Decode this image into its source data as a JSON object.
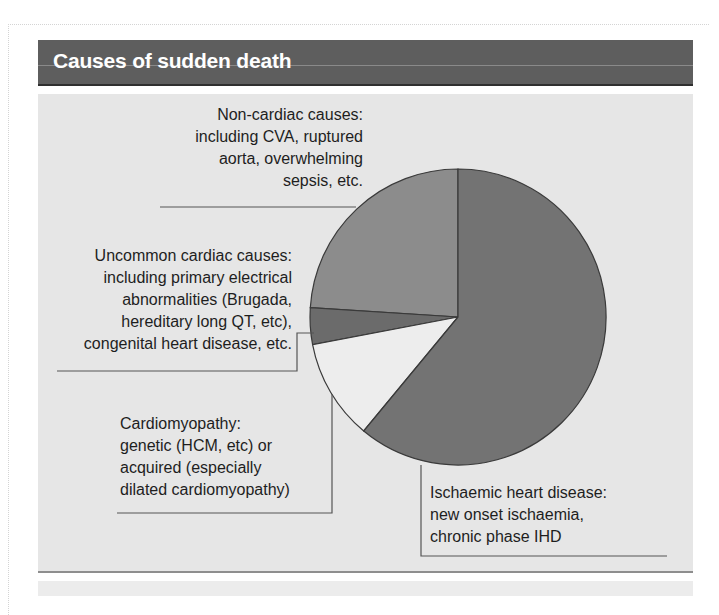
{
  "title": "Causes of sudden death",
  "chart_data": {
    "type": "pie",
    "title": "Causes of sudden death",
    "start_angle_deg": 90,
    "direction": "counterclockwise",
    "slices": [
      {
        "name": "Non-cardiac causes",
        "value": 24,
        "color": "#8c8c8c"
      },
      {
        "name": "Uncommon cardiac causes",
        "value": 4,
        "color": "#6b6b6b"
      },
      {
        "name": "Cardiomyopathy",
        "value": 11,
        "color": "#ededed"
      },
      {
        "name": "Ischaemic heart disease",
        "value": 61,
        "color": "#737373"
      }
    ],
    "annotations": [
      {
        "slice": "Non-cardiac causes",
        "lines": [
          "Non-cardiac causes:",
          "including CVA, ruptured",
          "aorta, overwhelming",
          "sepsis, etc."
        ]
      },
      {
        "slice": "Uncommon cardiac causes",
        "lines": [
          "Uncommon cardiac causes:",
          "including primary electrical",
          "abnormalities (Brugada,",
          "hereditary long QT, etc),",
          "congenital heart disease, etc."
        ]
      },
      {
        "slice": "Cardiomyopathy",
        "lines": [
          "Cardiomyopathy:",
          "genetic (HCM, etc) or",
          "acquired (especially",
          "dilated cardiomyopathy)"
        ]
      },
      {
        "slice": "Ischaemic heart disease",
        "lines": [
          "Ischaemic heart disease:",
          "new onset ischaemia,",
          "chronic phase IHD"
        ]
      }
    ],
    "legend": "none (leader-line labels)"
  },
  "colors": {
    "header_bg": "#5e5e5e",
    "panel_bg": "#e6e6e6",
    "text": "#1e1e1e",
    "leader_line": "#555555"
  }
}
